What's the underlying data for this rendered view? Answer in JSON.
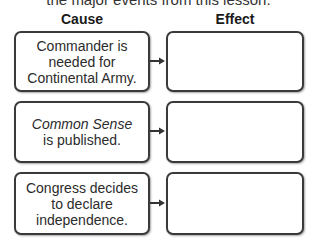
{
  "intro_text": "the major events from this lesson.",
  "headers": {
    "cause": "Cause",
    "effect": "Effect"
  },
  "rows": [
    {
      "cause_lines": [
        "Commander is",
        "needed for",
        "Continental Army."
      ],
      "effect": ""
    },
    {
      "cause_title_italic": "Common Sense",
      "cause_rest": "is published.",
      "effect": ""
    },
    {
      "cause_lines": [
        "Congress decides",
        "to declare",
        "independence."
      ],
      "effect": ""
    }
  ],
  "colors": {
    "border": "#3a3a3a",
    "text": "#2b2b2b",
    "background": "#ffffff"
  }
}
